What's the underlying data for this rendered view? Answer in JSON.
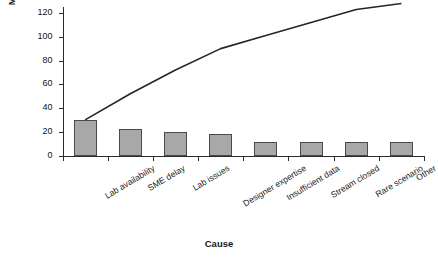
{
  "chart_data": {
    "type": "bar",
    "title": "",
    "subtitle": "",
    "xlabel": "Cause",
    "ylabel": "Magnitude",
    "categories": [
      "Lab availability",
      "SME delay",
      "Lab issues",
      "Designer expertise",
      "Insufficient data",
      "Stream closed",
      "Rare scenario",
      "Other"
    ],
    "values": [
      30,
      22,
      20,
      18,
      11,
      11,
      11,
      11
    ],
    "series": [
      {
        "name": "Magnitude",
        "type": "bar",
        "values": [
          30,
          22,
          20,
          18,
          11,
          11,
          11,
          11
        ]
      },
      {
        "name": "Cumulative",
        "type": "line",
        "values": [
          30,
          52,
          72,
          90,
          101,
          112,
          123,
          128
        ]
      }
    ],
    "cumulative": [
      30,
      52,
      72,
      90,
      101,
      112,
      123,
      128
    ],
    "yticks": [
      0,
      20,
      40,
      60,
      80,
      100,
      120
    ],
    "ytick_labels": [
      "0",
      "20",
      "40",
      "60",
      "80",
      "100",
      "120"
    ],
    "ylim": [
      0,
      130
    ],
    "grid": false,
    "legend": "none",
    "bar_color": "#a8a8a8",
    "bar_edge_color": "#4a4a4a",
    "line_color": "#262626",
    "axis_color": "#2b2b2b",
    "background": "#ffffff"
  },
  "axes": {
    "y_title": "Magnitude",
    "x_title": "Cause"
  }
}
